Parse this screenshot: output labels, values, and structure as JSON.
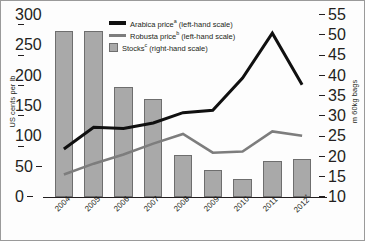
{
  "chart_data": {
    "type": "bar",
    "title": "",
    "subtitle": "",
    "xlabel": "",
    "ylabel": "US cents per lb",
    "ylabel_right": "m 60kg bags",
    "categories": [
      "2004",
      "2005",
      "2006",
      "2007",
      "2008",
      "2009",
      "2010",
      "2011",
      "2012"
    ],
    "category_marks": [
      "",
      "",
      "",
      "",
      "",
      "",
      "",
      "",
      "*"
    ],
    "ylim": [
      0,
      300
    ],
    "ylim_right": [
      10,
      55
    ],
    "yticks": [
      0,
      50,
      100,
      150,
      200,
      250,
      300
    ],
    "yticks_right": [
      10,
      15,
      20,
      25,
      30,
      35,
      40,
      45,
      50,
      55
    ],
    "grid": false,
    "legend_position": "top-center",
    "series": [
      {
        "name": "Arabica price",
        "marker": "*",
        "scale": "left",
        "axis_label": "(left-hand scale)",
        "type": "line",
        "color": "#101010",
        "values": [
          79,
          115,
          113,
          122,
          139,
          143,
          196,
          270,
          185
        ]
      },
      {
        "name": "Robusta price",
        "marker": "*",
        "scale": "left",
        "axis_label": "(left-hand scale)",
        "type": "line",
        "color": "#7d7d7d",
        "values": [
          37,
          55,
          70,
          88,
          104,
          73,
          75,
          108,
          101
        ]
      },
      {
        "name": "Stocks",
        "marker": "*",
        "scale": "right",
        "axis_label": "(right-hand scale)",
        "type": "bar",
        "color": "#a9a9a9",
        "values": [
          51.0,
          51.0,
          37.3,
          34.2,
          20.3,
          16.6,
          14.4,
          19.0,
          19.4
        ]
      }
    ]
  },
  "legend": {
    "items": [
      {
        "label": "Arabica price",
        "mark": "a",
        "scale_note": "(left-hand scale)"
      },
      {
        "label": "Robusta price",
        "mark": "b",
        "scale_note": "(left-hand scale)"
      },
      {
        "label": "Stocks",
        "mark": "c",
        "scale_note": "(right-hand scale)"
      }
    ]
  }
}
